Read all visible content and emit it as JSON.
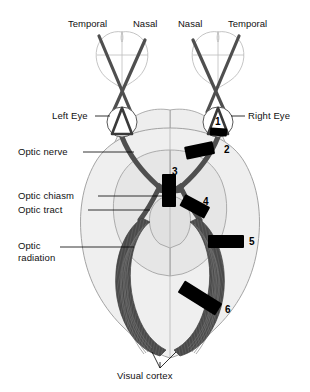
{
  "diagram": {
    "background": "#ffffff",
    "colors": {
      "brain_fill_outer": "#efefef",
      "brain_fill_inner": "#e4e4e4",
      "brain_outline": "#9a9a9a",
      "tract_dark": "#4f4f4f",
      "fiber_dark": "#4a4a4a",
      "lesion_black": "#000000",
      "field_outline": "#bdbdbd",
      "leader_line": "#000000",
      "eye_white": "#ffffff"
    }
  },
  "field_labels": [
    {
      "id": "left-temporal",
      "text": "Temporal",
      "x": 68,
      "y": 18
    },
    {
      "id": "left-nasal",
      "text": "Nasal",
      "x": 133,
      "y": 18
    },
    {
      "id": "right-nasal",
      "text": "Nasal",
      "x": 178,
      "y": 18
    },
    {
      "id": "right-temporal",
      "text": "Temporal",
      "x": 228,
      "y": 18
    }
  ],
  "structure_labels": [
    {
      "id": "left-eye",
      "text": "Left Eye",
      "x": 52,
      "y": 112
    },
    {
      "id": "right-eye",
      "text": "Right Eye",
      "x": 247,
      "y": 112
    },
    {
      "id": "optic-nerve",
      "text": "Optic nerve",
      "x": 18,
      "y": 148
    },
    {
      "id": "optic-chiasm",
      "text": "Optic chiasm",
      "x": 18,
      "y": 192
    },
    {
      "id": "optic-tract",
      "text": "Optic tract",
      "x": 18,
      "y": 206
    },
    {
      "id": "optic-radiation",
      "text": "Optic\nradiation",
      "line1": "Optic",
      "line2": "radiation",
      "x": 18,
      "y": 243
    },
    {
      "id": "visual-cortex",
      "text": "Visual cortex",
      "x": 117,
      "y": 372
    }
  ],
  "lesion_sites": [
    {
      "number": "1",
      "site": "optic nerve at right eye / retina",
      "label_x": 215,
      "label_y": 118
    },
    {
      "number": "2",
      "site": "right optic nerve",
      "label_x": 224,
      "label_y": 148
    },
    {
      "number": "3",
      "site": "optic chiasm",
      "label_x": 172,
      "label_y": 172
    },
    {
      "number": "4",
      "site": "right optic tract",
      "label_x": 203,
      "label_y": 202
    },
    {
      "number": "5",
      "site": "optic radiation (parietal)",
      "label_x": 248,
      "label_y": 240
    },
    {
      "number": "6",
      "site": "optic radiation (temporal/occipital)",
      "label_x": 224,
      "label_y": 309
    }
  ],
  "eyes": [
    {
      "id": "left-eye-globe",
      "cx": 122,
      "cy": 122,
      "r": 15,
      "has_number": false
    },
    {
      "id": "right-eye-globe",
      "cx": 218,
      "cy": 122,
      "r": 15,
      "has_number": true,
      "number": "1"
    }
  ]
}
